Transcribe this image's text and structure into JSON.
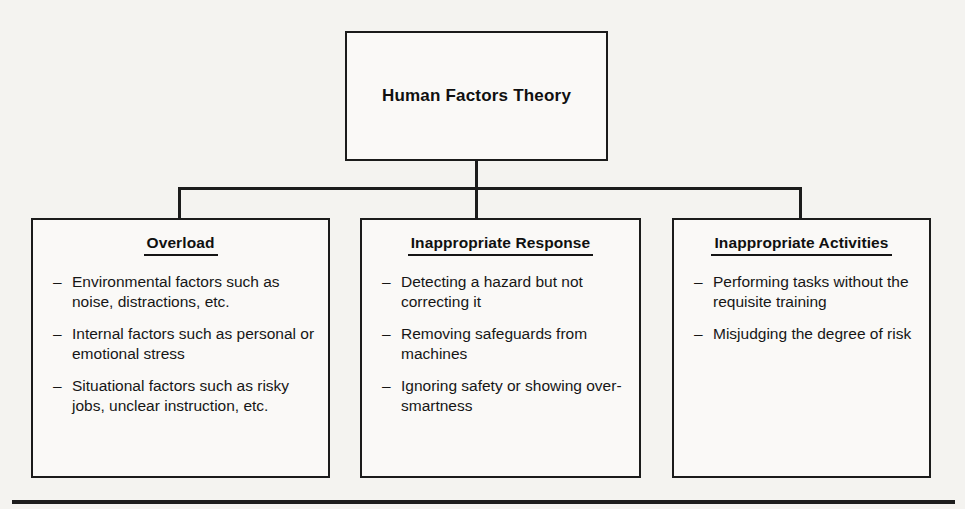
{
  "diagram": {
    "root": {
      "title": "Human Factors Theory"
    },
    "branches": [
      {
        "heading": "Overload",
        "bullet_marker": "–",
        "items": [
          "Environmental factors such as noise, distractions, etc.",
          "Internal factors such as personal or emotional stress",
          "Situational factors such as risky jobs, unclear instruction, etc."
        ]
      },
      {
        "heading": "Inappropriate Response",
        "bullet_marker": "–",
        "items": [
          "Detecting a hazard but not correcting it",
          "Removing safeguards from machines",
          "Ignoring safety or showing over-smartness"
        ]
      },
      {
        "heading": "Inappropriate Activities",
        "bullet_marker": "–",
        "items": [
          "Performing tasks without the requisite training",
          "Misjudging the degree of risk"
        ]
      }
    ],
    "colors": {
      "line": "#1b1b1b",
      "text": "#101010",
      "page_background": "#f4f3f0",
      "box_background": "#faf9f7"
    }
  }
}
